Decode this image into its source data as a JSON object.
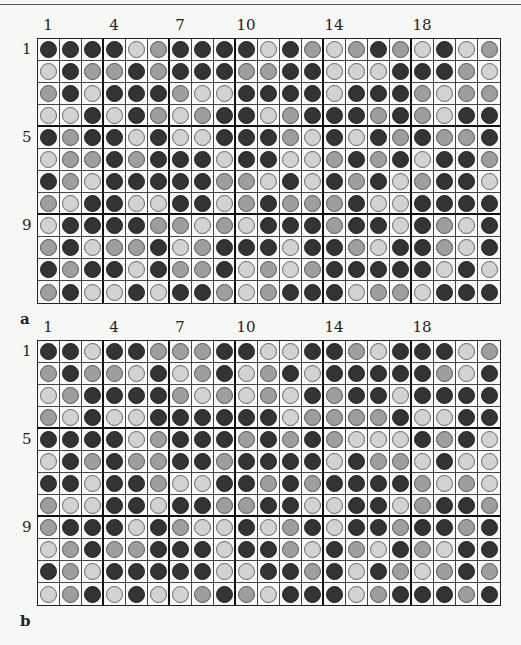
{
  "legend": {
    "D": "dark",
    "M": "medium",
    "L": "light"
  },
  "panels": [
    {
      "tag": "a",
      "col_labels": [
        {
          "text": "1",
          "col": 1
        },
        {
          "text": "4",
          "col": 4
        },
        {
          "text": "7",
          "col": 7
        },
        {
          "text": "10",
          "col": 10
        },
        {
          "text": "14",
          "col": 14
        },
        {
          "text": "18",
          "col": 18
        }
      ],
      "row_labels": [
        {
          "text": "1",
          "row": 1
        },
        {
          "text": "5",
          "row": 5
        },
        {
          "text": "9",
          "row": 9
        }
      ],
      "rows": [
        "DDDDLMDDDDLDMLMDMLDLM",
        "LDMMDMDDDMMDDLLLDDDML",
        "MDLDDDMLLDDDDLDDDMLMM",
        "LLDLDMLMDDLMDDDMDMLDD",
        "DMDDLDLLDDDMLDLDMDMMD",
        "LMMDMDDDLDDLLMDMDLDDM",
        "DMLDDDDDMMLDLDMDLMDDL",
        "MLDDLLDDLMDMMMDLLDDDD",
        "LDDDDMMLMLDDDMDDLDMLD",
        "MDLMMDLMDDDLDDMLDDMLD",
        "DMDDLDMMDLMLMDDDDDLDL",
        "MDLLDLDDMLMDDDLMMLDDD"
      ]
    },
    {
      "tag": "b",
      "col_labels": [
        {
          "text": "1",
          "col": 1
        },
        {
          "text": "4",
          "col": 4
        },
        {
          "text": "7",
          "col": 7
        },
        {
          "text": "10",
          "col": 10
        },
        {
          "text": "14",
          "col": 14
        },
        {
          "text": "18",
          "col": 18
        }
      ],
      "row_labels": [
        {
          "text": "1",
          "row": 1
        },
        {
          "text": "5",
          "row": 5
        },
        {
          "text": "9",
          "row": 9
        }
      ],
      "rows": [
        "DDLDDMMMDDLLDDMLDDDLM",
        "MDMMLDLMDLMDLDDDDDMLD",
        "LMDDDDMLMLMLDMDDLDDDD",
        "MLDLLDDDDDDLMMMMDLLDD",
        "DDDDLMDDDMDMDMLLLDMDL",
        "LDMDMMDDMDDDDLDMMLDLL",
        "DDLDDMLLDDMDMDDDDMLML",
        "MLLDDLDDMMDDLLDDLMDDM",
        "MDDDLDMLLDLMDLDDMDDMD",
        "LMDMMDDDLDDMLDMLDMLDD",
        "DMLDDDDDLLDDMDLDMLMDM",
        "LMDLDLLMDMLDDDLMDDDMD"
      ]
    }
  ],
  "grid": {
    "cols": 21,
    "rows": 12,
    "col_group_ends": [
      3,
      6,
      9,
      13,
      17
    ],
    "row_group_ends": [
      4,
      8
    ]
  }
}
